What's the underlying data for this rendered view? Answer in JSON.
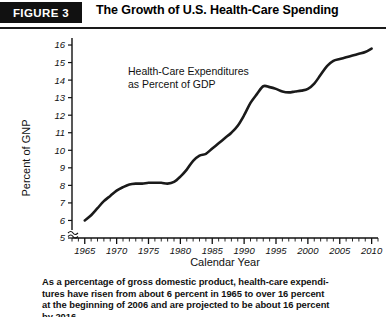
{
  "header": {
    "figure_badge": "FIGURE 3",
    "title": "The Growth of U.S. Health-Care Spending"
  },
  "caption": {
    "line1": "As a percentage of gross domestic product, health-care expendi-",
    "line2": "tures have risen from about 6 percent in 1965 to over 16 percent",
    "line3": "at the beginning of 2006 and are projected to be about 16 percent",
    "line4": "by 2016."
  },
  "chart_data": {
    "type": "line",
    "title": "The Growth of U.S. Health-Care Spending",
    "annotation": {
      "line1": "Health-Care Expenditures",
      "line2": "as Percent of GDP"
    },
    "xlabel": "Calendar Year",
    "ylabel": "Percent of GNP",
    "xlim": [
      1963,
      2011
    ],
    "ylim": [
      5,
      16.4
    ],
    "y_ticks": [
      5,
      6,
      7,
      8,
      9,
      10,
      11,
      12,
      13,
      14,
      15,
      16
    ],
    "x_ticks": [
      1965,
      1970,
      1975,
      1980,
      1985,
      1990,
      1995,
      2000,
      2005,
      2010
    ],
    "x_minor_tick_step": 1,
    "axis_break": true,
    "grid": false,
    "legend": "none",
    "line_color": "#1a1a1a",
    "series": [
      {
        "name": "Health-Care Expenditures as Percent of GDP",
        "x": [
          1965,
          1966,
          1967,
          1968,
          1969,
          1970,
          1971,
          1972,
          1973,
          1974,
          1975,
          1976,
          1977,
          1978,
          1979,
          1980,
          1981,
          1982,
          1983,
          1984,
          1985,
          1986,
          1987,
          1988,
          1989,
          1990,
          1991,
          1992,
          1993,
          1994,
          1995,
          1996,
          1997,
          1998,
          1999,
          2000,
          2001,
          2002,
          2003,
          2004,
          2005,
          2006,
          2007,
          2008,
          2009,
          2010
        ],
        "values": [
          6.0,
          6.3,
          6.7,
          7.1,
          7.4,
          7.7,
          7.9,
          8.05,
          8.1,
          8.1,
          8.15,
          8.15,
          8.15,
          8.1,
          8.2,
          8.5,
          8.9,
          9.4,
          9.7,
          9.8,
          10.1,
          10.4,
          10.7,
          11.0,
          11.4,
          12.0,
          12.7,
          13.2,
          13.65,
          13.6,
          13.5,
          13.35,
          13.3,
          13.35,
          13.4,
          13.5,
          13.8,
          14.3,
          14.8,
          15.1,
          15.2,
          15.3,
          15.4,
          15.5,
          15.6,
          15.8
        ]
      }
    ]
  }
}
